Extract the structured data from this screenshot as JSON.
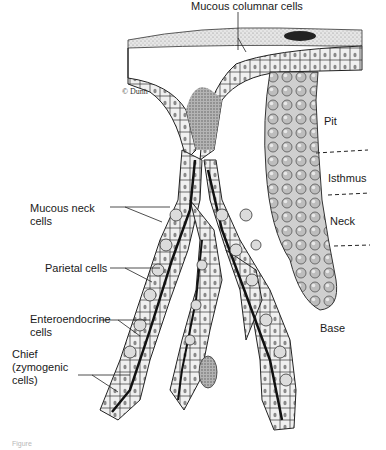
{
  "figure": {
    "signature": "© Dunn",
    "labels": {
      "mucous_columnar": "Mucous columnar cells",
      "mucous_neck": "Mucous neck\ncells",
      "parietal": "Parietal cells",
      "enteroendocrine": "Enteroendocrine\ncells",
      "chief": "Chief\n(zymogenic\ncells)"
    },
    "regions": {
      "pit": "Pit",
      "isthmus": "Isthmus",
      "neck": "Neck",
      "base": "Base"
    },
    "caption_fragment": "Figure"
  }
}
